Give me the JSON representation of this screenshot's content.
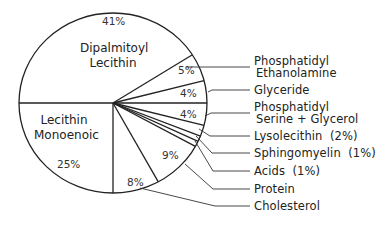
{
  "chart_data": {
    "type": "pie",
    "title": "",
    "start_angle_deg": 180,
    "direction": "clockwise",
    "slices": [
      {
        "label": "Dipalmitoyl Lecithin",
        "value": 41,
        "pct_label": "41%",
        "label_placement": "inside"
      },
      {
        "label": "Phosphatidyl Ethanolamine",
        "value": 5,
        "pct_label": "5%",
        "label_placement": "leader"
      },
      {
        "label": "Glyceride",
        "value": 4,
        "pct_label": "4%",
        "label_placement": "leader"
      },
      {
        "label": "Phosphatidyl Serine + Glycerol",
        "value": 4,
        "pct_label": "4%",
        "label_placement": "leader"
      },
      {
        "label": "Lysolecithin",
        "value": 2,
        "pct_label": "(2%)",
        "label_placement": "leader"
      },
      {
        "label": "Sphingomyelin",
        "value": 1,
        "pct_label": "(1%)",
        "label_placement": "leader"
      },
      {
        "label": "Acids",
        "value": 1,
        "pct_label": "(1%)",
        "label_placement": "leader"
      },
      {
        "label": "Protein",
        "value": 9,
        "pct_label": "9%",
        "label_placement": "leader"
      },
      {
        "label": "Cholesterol",
        "value": 8,
        "pct_label": "8%",
        "label_placement": "leader"
      },
      {
        "label": "Lecithin Monoenoic",
        "value": 25,
        "pct_label": "25%",
        "label_placement": "inside"
      }
    ],
    "colors": {
      "stroke": "#222222",
      "fill": "#ffffff"
    }
  },
  "labels": {
    "dipalmitoyl": {
      "line1": "Dipalmitoyl",
      "line2": "Lecithin",
      "pct": "41%"
    },
    "monoenoic": {
      "line1": "Lecithin",
      "line2": "Monoenoic",
      "pct": "25%"
    },
    "pe": {
      "line1": "Phosphatidyl",
      "line2": "Ethanolamine",
      "pct": "5%"
    },
    "glyceride": {
      "line1": "Glyceride",
      "pct": "4%"
    },
    "ps": {
      "line1": "Phosphatidyl",
      "line2": "Serine + Glycerol",
      "pct": "4%"
    },
    "lyso": {
      "line1": "Lysolecithin  (2%)"
    },
    "sphingo": {
      "line1": "Sphingomyelin  (1%)"
    },
    "acids": {
      "line1": "Acids  (1%)"
    },
    "protein": {
      "line1": "Protein",
      "pct": "9%"
    },
    "cholesterol": {
      "line1": "Cholesterol",
      "pct": "8%"
    }
  }
}
